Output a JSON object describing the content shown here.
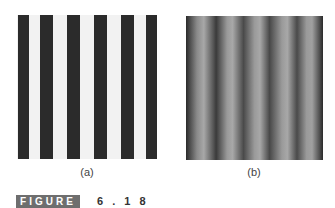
{
  "figure": {
    "label": "FIGURE",
    "number": "6.18",
    "number_display": "6 . 1 8",
    "badge_color": "#6e6e6e"
  },
  "panels": [
    {
      "id": "a",
      "caption": "(a)",
      "type": "square-wave bar pattern",
      "bar_color": "#2b2b2b",
      "bg_color": "#f2f2f2",
      "dark_bars": 6
    },
    {
      "id": "b",
      "caption": "(b)",
      "type": "sinusoidal grating",
      "cycles_visible": 5
    }
  ]
}
